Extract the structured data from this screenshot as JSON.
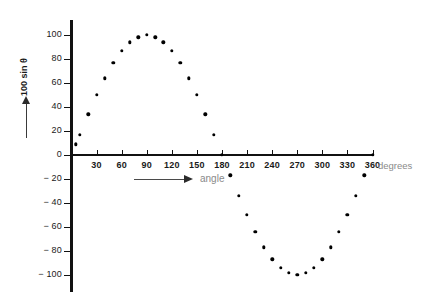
{
  "chart_data": {
    "type": "scatter",
    "title": "",
    "xlabel": "angle",
    "xunit": "degrees",
    "ylabel": "100 sin θ",
    "xlim": [
      0,
      360
    ],
    "ylim": [
      -100,
      100
    ],
    "grid": false,
    "legend": null,
    "x_ticks": [
      30,
      60,
      90,
      120,
      150,
      180,
      210,
      240,
      270,
      300,
      330,
      360
    ],
    "x_tick_labels": [
      "30",
      "60",
      "90",
      "120",
      "150",
      "180",
      "210",
      "240",
      "270",
      "300",
      "330",
      "360"
    ],
    "y_ticks": [
      100,
      80,
      60,
      40,
      20,
      0,
      -20,
      -40,
      -60,
      -80,
      -100
    ],
    "y_tick_labels": [
      "100",
      "80",
      "60",
      "40",
      "20",
      "0",
      "− 20",
      "− 40",
      "− 60",
      "− 80",
      "− 100"
    ],
    "marker": "filled-circle",
    "marker_color": "#000000",
    "x": [
      5,
      10,
      20,
      30,
      40,
      50,
      60,
      70,
      80,
      90,
      100,
      110,
      120,
      130,
      140,
      150,
      160,
      170,
      180,
      190,
      200,
      210,
      220,
      230,
      240,
      250,
      260,
      270,
      280,
      290,
      300,
      310,
      320,
      330,
      340,
      350,
      360
    ],
    "values": [
      9,
      17,
      34,
      50,
      64,
      77,
      87,
      94,
      98,
      100,
      98,
      94,
      87,
      77,
      64,
      50,
      34,
      17,
      0,
      -17,
      -34,
      -50,
      -64,
      -77,
      -87,
      -94,
      -98,
      -100,
      -98,
      -94,
      -87,
      -77,
      -64,
      -50,
      -34,
      -17,
      0
    ],
    "series": [
      {
        "name": "100 sin θ",
        "x": [
          5,
          10,
          20,
          30,
          40,
          50,
          60,
          70,
          80,
          90,
          100,
          110,
          120,
          130,
          140,
          150,
          160,
          170,
          180,
          190,
          200,
          210,
          220,
          230,
          240,
          250,
          260,
          270,
          280,
          290,
          300,
          310,
          320,
          330,
          340,
          350,
          360
        ],
        "values": [
          9,
          17,
          34,
          50,
          64,
          77,
          87,
          94,
          98,
          100,
          98,
          94,
          87,
          77,
          64,
          50,
          34,
          17,
          0,
          -17,
          -34,
          -50,
          -64,
          -77,
          -87,
          -94,
          -98,
          -100,
          -98,
          -94,
          -87,
          -77,
          -64,
          -50,
          -34,
          -17,
          0
        ]
      }
    ]
  },
  "axes": {
    "y_axis_title": "100 sin θ",
    "x_axis_title": "angle",
    "x_axis_unit": "degrees"
  },
  "colors": {
    "marker": "#000000",
    "axis": "#111111",
    "muted_text": "#8a8a8a",
    "background": "#ffffff"
  }
}
